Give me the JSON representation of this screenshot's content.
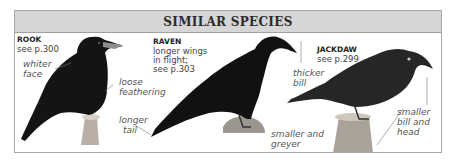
{
  "panel": {
    "title": "SIMILAR SPECIES",
    "header_color": "#d6d6d6",
    "border_color": "#a9a9a9"
  },
  "species": [
    {
      "name": "ROOK",
      "reference": "see p.300",
      "notes": [
        "longer wings",
        "in flight;"
      ],
      "annotations": [
        {
          "line1": "whiter",
          "line2": "face"
        },
        {
          "line1": "loose",
          "line2": "feathering"
        }
      ]
    },
    {
      "name": "RAVEN",
      "desc1": "longer wings",
      "desc2": "in flight;",
      "reference": "see p.303",
      "annotations": [
        {
          "line1": "longer",
          "line2": "tail"
        },
        {
          "line1": "thicker",
          "line2": "bill"
        }
      ]
    },
    {
      "name": "JACKDAW",
      "reference": "see p.299",
      "annotations": [
        {
          "line1": "smaller and",
          "line2": "greyer"
        },
        {
          "line1": "smaller",
          "line2": "bill and",
          "line3": "head"
        }
      ]
    }
  ]
}
